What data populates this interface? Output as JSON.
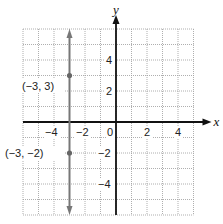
{
  "chart_data": {
    "type": "line",
    "title": "",
    "xlabel": "x",
    "ylabel": "y",
    "xlim": [
      -6,
      5
    ],
    "ylim": [
      -6,
      6
    ],
    "grid": true,
    "grid_style": "dotted",
    "x_ticks": [
      -4,
      -2,
      0,
      2,
      4
    ],
    "y_ticks": [
      4,
      2,
      -2,
      -4
    ],
    "x_tick_labels": [
      "−4",
      "−2",
      "0",
      "2",
      "4"
    ],
    "y_tick_labels": [
      "4",
      "2",
      "−2",
      "−4"
    ],
    "series": [
      {
        "name": "vertical line x = -3",
        "type": "line",
        "x": [
          -3,
          -3
        ],
        "y": [
          -6,
          6
        ],
        "arrows": "both",
        "color": "#777777"
      },
      {
        "name": "points",
        "type": "scatter",
        "points": [
          {
            "x": -3,
            "y": 3,
            "label": "(−3, 3)"
          },
          {
            "x": -3,
            "y": -2,
            "label": "(−3, −2)"
          }
        ],
        "color": "#666666"
      }
    ],
    "annotations": [
      "(−3, 3)",
      "(−3, −2)"
    ]
  },
  "colors": {
    "axis": "#111111",
    "grid": "#9a9a9a",
    "line": "#777777",
    "point": "#666666",
    "background": "#ffffff"
  }
}
